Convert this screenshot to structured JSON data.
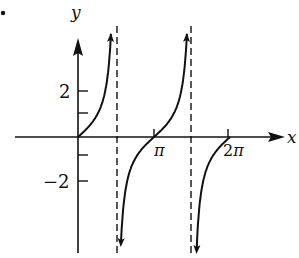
{
  "chart_data": {
    "type": "line",
    "title": "",
    "function": "y = tan x",
    "xlabel": "x",
    "ylabel": "y",
    "x_ticks": [
      {
        "value": 3.14159,
        "label": "π"
      },
      {
        "value": 6.28319,
        "label": "2π"
      }
    ],
    "y_ticks": [
      {
        "value": 2,
        "label": "2"
      },
      {
        "value": 1,
        "label": ""
      },
      {
        "value": -1,
        "label": ""
      },
      {
        "value": -2,
        "label": "−2"
      }
    ],
    "asymptotes": [
      1.5708,
      4.7124
    ],
    "branches": [
      {
        "x_from": 0,
        "x_to": 1.5708,
        "description": "rises from origin to +∞"
      },
      {
        "x_from": 1.5708,
        "x_to": 4.7124,
        "description": "from −∞ through (π,0) to +∞"
      },
      {
        "x_from": 4.7124,
        "x_to": 6.28319,
        "description": "from −∞ up to (2π,0)"
      }
    ],
    "xlim": [
      -3.2,
      9.3
    ],
    "ylim": [
      -5.2,
      6.0
    ],
    "grid": false,
    "legend": null
  },
  "labels": {
    "x_axis": "x",
    "y_axis": "y",
    "tick_pi": "π",
    "tick_2pi": "2π",
    "tick_y2": "2",
    "tick_yneg2": "−2",
    "marker": "."
  },
  "colors": {
    "ink": "#111111",
    "background": "#ffffff"
  }
}
